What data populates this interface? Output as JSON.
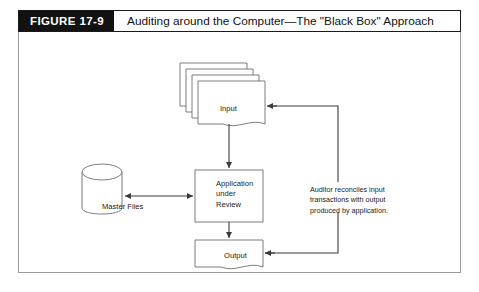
{
  "figure": {
    "number": "FIGURE 17-9",
    "title": "Auditing around the Computer—The \"Black Box\" Approach"
  },
  "diagram": {
    "type": "flowchart",
    "nodes": [
      {
        "id": "input",
        "shape": "document-stack",
        "label": "Input",
        "stack_count": 4
      },
      {
        "id": "master_files",
        "shape": "cylinder",
        "label": "Master Files"
      },
      {
        "id": "application",
        "shape": "rectangle",
        "label": "Application\nunder\nReview"
      },
      {
        "id": "output",
        "shape": "document",
        "label": "Output"
      }
    ],
    "annotation": "Auditor reconciles input\ntransactions with output\nproduced by application.",
    "connectors": [
      {
        "from": "input",
        "to": "application",
        "direction": "down",
        "arrow": "single"
      },
      {
        "from": "master_files",
        "to": "application",
        "direction": "right",
        "arrow": "double"
      },
      {
        "from": "application",
        "to": "output",
        "direction": "down",
        "arrow": "single"
      },
      {
        "from": "auditor-path",
        "to": "input",
        "direction": "left",
        "arrow": "single"
      },
      {
        "from": "auditor-path",
        "to": "output",
        "direction": "left",
        "arrow": "single"
      }
    ]
  },
  "colors": {
    "header_bar": "#121212",
    "header_text": "#ffffff",
    "line": "#4d4d4d",
    "shape_stroke": "#6b6b6b",
    "text": "#1b1b1b"
  }
}
